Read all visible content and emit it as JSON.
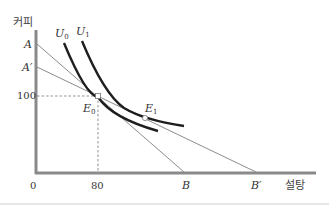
{
  "diagram": {
    "type": "indifference-curve-budget-line",
    "y_axis_label": "커피",
    "x_axis_label": "설탕",
    "origin_label": "0",
    "y_tick_100": "100",
    "x_tick_80": "80",
    "points": {
      "A": "A",
      "A_prime": "A′",
      "B": "B",
      "B_prime": "B′",
      "E0_main": "E",
      "E0_sub": "0",
      "E1_main": "E",
      "E1_sub": "1"
    },
    "curves": {
      "U0_main": "U",
      "U0_sub": "0",
      "U1_main": "U",
      "U1_sub": "1"
    },
    "colors": {
      "axis": "#8a8a8a",
      "budget_line": "#8c8c8c",
      "curve": "#1e1e1e",
      "dashed": "#777777",
      "separator": "#cfcfcf"
    }
  }
}
